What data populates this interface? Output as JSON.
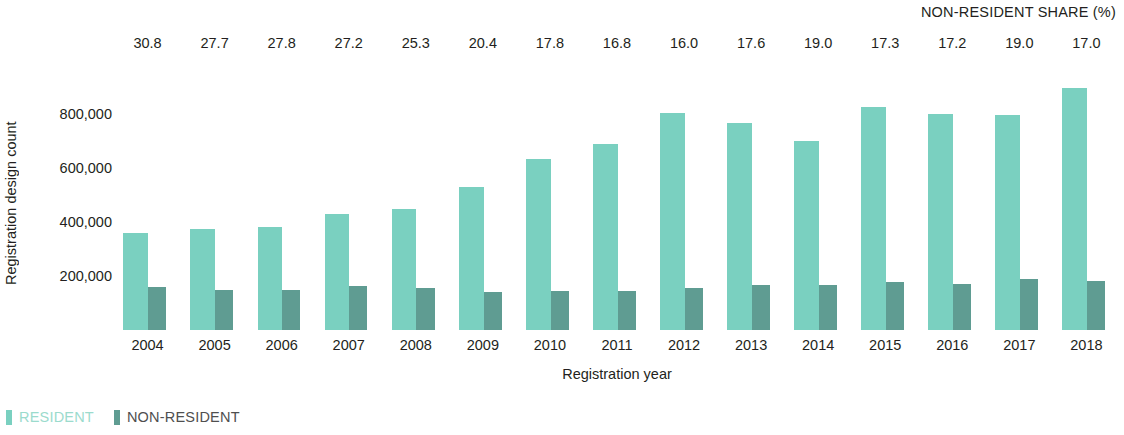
{
  "chart_data": {
    "type": "bar",
    "title": "",
    "subtitle": "",
    "xlabel": "Registration year",
    "ylabel": "Registration design count",
    "categories": [
      "2004",
      "2005",
      "2006",
      "2007",
      "2008",
      "2009",
      "2010",
      "2011",
      "2012",
      "2013",
      "2014",
      "2015",
      "2016",
      "2017",
      "2018"
    ],
    "ylim": [
      0,
      1000000
    ],
    "yticks": [
      200000,
      400000,
      600000,
      800000
    ],
    "ytick_labels": [
      "200,000",
      "400,000",
      "600,000",
      "800,000"
    ],
    "grid": false,
    "legend_position": "bottom-left",
    "bar_mode": "overlapping",
    "series": [
      {
        "name": "RESIDENT",
        "color": "#7ad0c0",
        "values": [
          360000,
          375000,
          380000,
          430000,
          450000,
          530000,
          635000,
          690000,
          805000,
          765000,
          700000,
          825000,
          800000,
          795000,
          895000
        ]
      },
      {
        "name": "NON-RESIDENT",
        "color": "#5f9c92",
        "values": [
          160000,
          150000,
          150000,
          162000,
          155000,
          140000,
          145000,
          143000,
          155000,
          165000,
          168000,
          178000,
          172000,
          190000,
          182000
        ]
      }
    ],
    "annotation_row": {
      "title": "NON-RESIDENT SHARE (%)",
      "values": [
        "30.8",
        "27.7",
        "27.8",
        "27.2",
        "25.3",
        "20.4",
        "17.8",
        "16.8",
        "16.0",
        "17.6",
        "19.0",
        "17.3",
        "17.2",
        "19.0",
        "17.0"
      ]
    }
  },
  "legend": {
    "items": [
      {
        "label": "RESIDENT",
        "color": "#7ad0c0"
      },
      {
        "label": "NON-RESIDENT",
        "color": "#5f9c92"
      }
    ]
  }
}
